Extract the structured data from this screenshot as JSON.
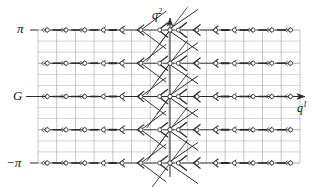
{
  "figure": {
    "type": "vector-field-lattice-diagram",
    "background_color": "#ffffff",
    "ink_color": "#2b2b2b",
    "grid_color": "#9aa0a6",
    "node_fill": "#ffffff",
    "node_stroke": "#333333"
  },
  "axes": {
    "horizontal": {
      "name": "q1-axis",
      "label": "q",
      "label_superscript": "1",
      "label_full": "q¹",
      "y_value_label": "G",
      "arrow": "right"
    },
    "vertical": {
      "name": "q2-axis",
      "label": "q",
      "label_superscript": "2",
      "label_full": "q²",
      "arrow": "up"
    }
  },
  "tick_labels": {
    "top": "π",
    "middle": "G",
    "bottom": "−π"
  },
  "chart_data": {
    "type": "scatter",
    "title": "",
    "xlabel": "q¹",
    "ylabel": "q²",
    "grid": true,
    "legend": false,
    "xlim": [
      -7,
      7
    ],
    "ylim": [
      -3.14159,
      3.14159
    ],
    "ytick_labels": [
      "π",
      "G",
      "−π"
    ],
    "ytick_values": [
      3.14159,
      0,
      -3.14159
    ],
    "major_rows": 5,
    "major_columns": 14,
    "minor_rows_per_major": 3,
    "node_rows_y": [
      3.14159,
      1.5708,
      0,
      -1.5708,
      -3.14159
    ],
    "node_columns_x": [
      -6.5,
      -5.5,
      -4.5,
      -3.5,
      -2.5,
      -1.5,
      -0.5,
      0.5,
      1.5,
      2.5,
      3.5,
      4.5,
      5.5,
      6.5
    ],
    "flow_direction": "leftward",
    "annotation": "Chevron arrowheads grow in size approaching the central q² axis; diagonal separatrix lines emanate from the central column nodes."
  },
  "geometry": {
    "grid_left": 38,
    "grid_right": 300,
    "grid_top": 30,
    "grid_bottom": 163,
    "center_x": 170,
    "center_y": 96.5,
    "major_row_spacing": 33.25,
    "minor_row_spacing": 11.08,
    "col_spacing": 18.71
  }
}
